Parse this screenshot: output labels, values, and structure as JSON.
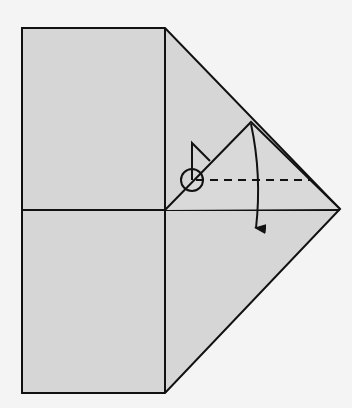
{
  "diagram": {
    "type": "origami-fold-step",
    "colors": {
      "background": "#f4f4f4",
      "paper": "#d6d6d6",
      "stroke": "#111111"
    },
    "shapes": {
      "paper_outline": "22,28 165,28 340,209 165,393 22,393",
      "vertical_crease": [
        165,
        28,
        165,
        393
      ],
      "horizontal_crease": [
        22,
        210,
        340,
        210
      ],
      "flap_triangle": "165,210 251,122 340,209",
      "valley_fold_line": [
        196,
        180,
        310,
        180
      ],
      "pivot_circle": {
        "cx": 192,
        "cy": 180,
        "r": 11
      },
      "flag_marker": "192,180 192,143 210,161",
      "fold_arrow_path": "M251,124 Q262,175 256,228"
    },
    "annotations": {
      "fold_direction": "fold flap down along dashed valley line",
      "pivot_marker": "circled reference point"
    }
  }
}
